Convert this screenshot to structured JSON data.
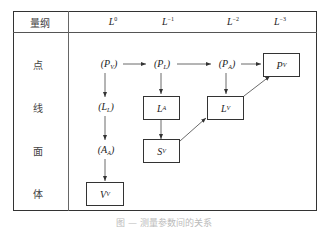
{
  "table": {
    "header": {
      "label": "量纲",
      "columns": [
        {
          "base": "L",
          "exp": "0"
        },
        {
          "base": "L",
          "exp": "−1"
        },
        {
          "base": "L",
          "exp": "−2"
        },
        {
          "base": "L",
          "exp": "−3"
        }
      ]
    },
    "rows": [
      {
        "label": "点"
      },
      {
        "label": "线"
      },
      {
        "label": "面"
      },
      {
        "label": "体"
      }
    ]
  },
  "nodes": {
    "pv_paren": {
      "base": "P",
      "sub": "V",
      "open": "(",
      "close": ")"
    },
    "pl_paren": {
      "base": "P",
      "sub": "L",
      "open": "(",
      "close": ")"
    },
    "pa_paren": {
      "base": "P",
      "sub": "A",
      "open": "(",
      "close": ")"
    },
    "pv_box": {
      "base": "P",
      "sub": "V"
    },
    "ll_paren": {
      "base": "L",
      "sub": "L",
      "open": "(",
      "close": ")"
    },
    "la_box": {
      "base": "L",
      "sub": "A"
    },
    "lv_box": {
      "base": "L",
      "sub": "V"
    },
    "aa_paren": {
      "base": "A",
      "sub": "A",
      "open": "(",
      "close": ")"
    },
    "sv_box": {
      "base": "S",
      "sub": "V"
    },
    "vv_box": {
      "base": "V",
      "sub": "V"
    }
  },
  "caption": "图 — 测量参数间的关系"
}
